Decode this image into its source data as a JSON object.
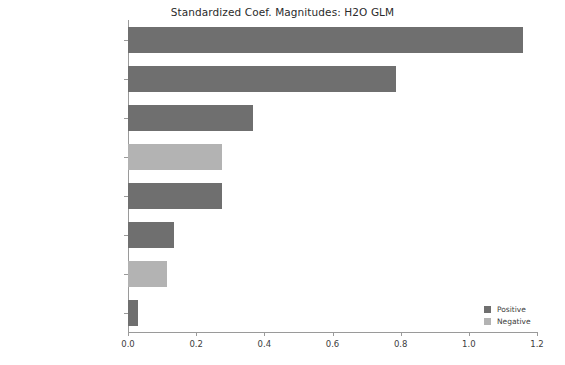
{
  "chart_data": {
    "type": "bar",
    "orientation": "horizontal",
    "title": "Standardized Coef. Magnitudes: H2O GLM",
    "xlabel": "",
    "ylabel": "",
    "xlim": [
      0.0,
      1.2
    ],
    "grid": false,
    "categories": [
      "Glucose",
      "BMI",
      "Pregnancies",
      "BloodPressure",
      "DiabetesPedigreeFunction",
      "Age",
      "Insulin",
      "SkinThickness"
    ],
    "values": [
      1.16,
      0.785,
      0.367,
      0.277,
      0.277,
      0.136,
      0.114,
      0.03
    ],
    "signs": [
      "Positive",
      "Positive",
      "Positive",
      "Negative",
      "Positive",
      "Positive",
      "Negative",
      "Positive"
    ],
    "xticks": [
      "0.0",
      "0.2",
      "0.4",
      "0.6",
      "0.8",
      "1.0",
      "1.2"
    ],
    "xtick_values": [
      0.0,
      0.2,
      0.4,
      0.6,
      0.8,
      1.0,
      1.2
    ],
    "legend": {
      "position": "lower-right",
      "entries": [
        {
          "label": "Positive",
          "color": "#6f6f6f"
        },
        {
          "label": "Negative",
          "color": "#b3b3b3"
        }
      ]
    },
    "colors": {
      "positive": "#6f6f6f",
      "negative": "#b3b3b3",
      "axis": "#9a9a9a",
      "text": "#3d3d3d",
      "background": "#ffffff"
    }
  }
}
